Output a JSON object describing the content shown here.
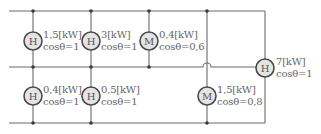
{
  "diagram": {
    "type": "electrical-wiring",
    "colors": {
      "wire": "#6a6a6a",
      "circle_fill": "#e4e4e4",
      "circle_stroke": "#4a4a4a",
      "text": "#666666"
    },
    "buses": [
      "top",
      "middle",
      "bottom"
    ],
    "loads": [
      {
        "id": "h1",
        "symbol": "H",
        "power": "1,5[kW]",
        "pf": "cosθ=1",
        "position": "upper-left"
      },
      {
        "id": "h2",
        "symbol": "H",
        "power": "3[kW]",
        "pf": "cosθ=1",
        "position": "upper"
      },
      {
        "id": "m1",
        "symbol": "M",
        "power": "0,4[kW]",
        "pf": "cosθ=0,6",
        "position": "upper"
      },
      {
        "id": "h3",
        "symbol": "H",
        "power": "0,4[kW]",
        "pf": "cosθ=1",
        "position": "lower-left"
      },
      {
        "id": "h4",
        "symbol": "H",
        "power": "0,5[kW]",
        "pf": "cosθ=1",
        "position": "lower"
      },
      {
        "id": "m2",
        "symbol": "M",
        "power": "1,5[kW]",
        "pf": "cosθ=0,8",
        "position": "lower"
      },
      {
        "id": "h5",
        "symbol": "H",
        "power": "7[kW]",
        "pf": "cosθ=1",
        "position": "right"
      }
    ]
  }
}
